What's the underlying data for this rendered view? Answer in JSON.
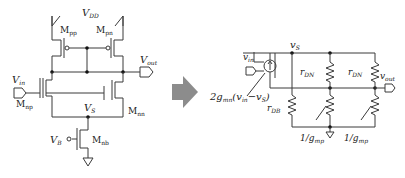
{
  "left_circuit": {
    "title": "Differential pair with current-mirror load",
    "supply": {
      "main": "V",
      "sub": "DD"
    },
    "transistors": [
      {
        "id": "pp",
        "main": "M",
        "sub": "pp"
      },
      {
        "id": "pn",
        "main": "M",
        "sub": "pn"
      },
      {
        "id": "np",
        "main": "M",
        "sub": "np"
      },
      {
        "id": "nn",
        "main": "M",
        "sub": "nn"
      },
      {
        "id": "nb",
        "main": "M",
        "sub": "nb"
      }
    ],
    "ports": {
      "vin": {
        "main": "V",
        "sub": "in"
      },
      "vout": {
        "main": "V",
        "sub": "out"
      },
      "vs": {
        "main": "V",
        "sub": "S"
      },
      "vb": {
        "main": "V",
        "sub": "B"
      }
    }
  },
  "arrow": {
    "color": "#8c8c8c",
    "direction": "right"
  },
  "right_circuit": {
    "title": "Small-signal equivalent circuit",
    "node_vs": {
      "main": "v",
      "sub": "S"
    },
    "input": {
      "main": "v",
      "sub": "in"
    },
    "output": {
      "main": "v",
      "sub": "out"
    },
    "current_source": {
      "prefix": "2g",
      "sub": "mn",
      "expr": "(v",
      "expr_sub1": "in",
      "minus": "−v",
      "expr_sub2": "S",
      "close": ")"
    },
    "resistors": [
      {
        "id": "rdn1",
        "main": "r",
        "sub": "DN"
      },
      {
        "id": "rdn2",
        "main": "r",
        "sub": "DN"
      },
      {
        "id": "rdb",
        "main": "r",
        "sub": "DB"
      },
      {
        "id": "gmp1",
        "main": "1/g",
        "sub": "mp"
      },
      {
        "id": "gmp2",
        "main": "1/g",
        "sub": "mp"
      }
    ]
  }
}
